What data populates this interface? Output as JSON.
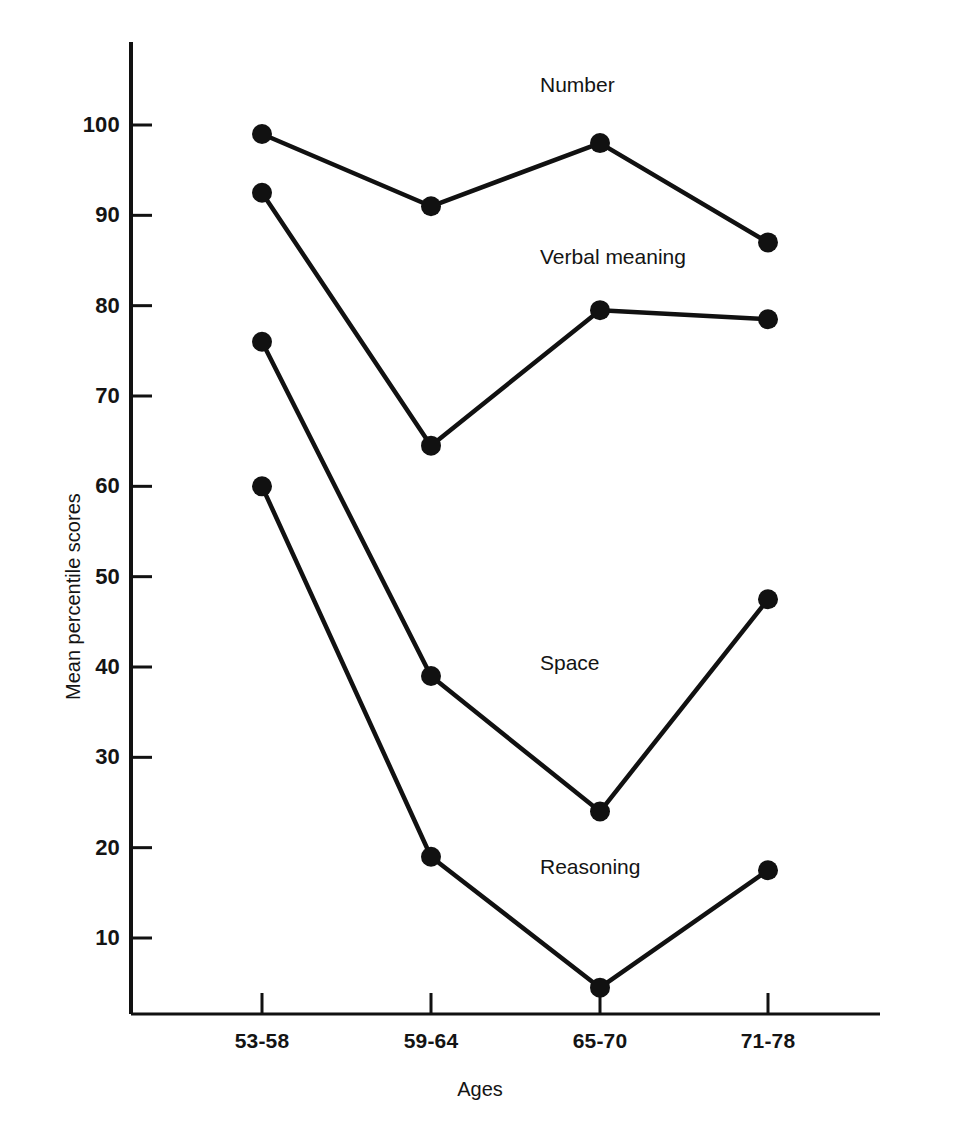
{
  "chart_data": {
    "type": "line",
    "title": "",
    "xlabel": "Ages",
    "ylabel": "Mean percentile scores",
    "categories": [
      "53-58",
      "59-64",
      "65-70",
      "71-78"
    ],
    "ylim": [
      0,
      107
    ],
    "yticks": [
      10,
      20,
      30,
      40,
      50,
      60,
      70,
      80,
      90,
      100
    ],
    "ytick_labels": [
      "10",
      "20",
      "30",
      "40",
      "50",
      "60",
      "70",
      "80",
      "90",
      "100"
    ],
    "grid": false,
    "legend": "inline-labels",
    "marker": "filled-circle",
    "line_color": "#111111",
    "series": [
      {
        "name": "Number",
        "values": [
          99.0,
          91.0,
          98.0,
          87.0
        ],
        "label_x_pct": 60.0,
        "label_y_value": 104.5
      },
      {
        "name": "Verbal meaning",
        "values": [
          92.5,
          64.5,
          79.5,
          78.5
        ],
        "label_x_pct": 60.0,
        "label_y_value": 85.5
      },
      {
        "name": "Space",
        "values": [
          76.0,
          39.0,
          24.0,
          47.5
        ],
        "label_x_pct": 60.0,
        "label_y_value": 40.5
      },
      {
        "name": "Reasoning",
        "values": [
          60.0,
          19.0,
          4.5,
          17.5
        ],
        "label_x_pct": 60.0,
        "label_y_value": 18.0
      }
    ]
  },
  "axis": {
    "y_axis_name": "y-axis",
    "x_axis_name": "x-axis"
  }
}
